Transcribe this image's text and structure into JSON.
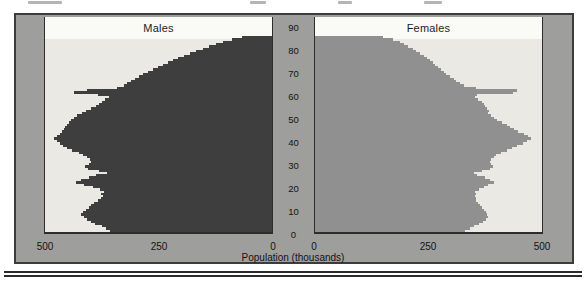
{
  "colors": {
    "male_bar": "#3e3e3e",
    "female_bar": "#909090",
    "panel_background": "#ebe9e4",
    "top_band": "#fafaf6",
    "matte_background": "#9e9e9c",
    "frame_border": "#3c3c3c",
    "axis_line": "#2d2d2d",
    "text": "#141414",
    "bottom_rule": "#2b2b2b"
  },
  "chart_data": {
    "type": "bar",
    "subtype": "population-pyramid",
    "orientation": "horizontal",
    "xlabel": "Population (thousands)",
    "age_axis": {
      "ticks": [
        0,
        10,
        20,
        30,
        40,
        50,
        60,
        70,
        80,
        90
      ],
      "min": 0,
      "max_drawn_age": 84,
      "bin_years": 1
    },
    "x_axis": {
      "max_each_side": 500,
      "unit": "thousands",
      "left_panel_ticks": [
        500,
        250,
        0
      ],
      "right_panel_ticks": [
        0,
        250,
        500
      ]
    },
    "legend_position": "panel-top-band",
    "series": [
      {
        "name": "Males",
        "side": "left",
        "color": "#3e3e3e",
        "age_start": 0,
        "values": [
          355,
          365,
          372,
          388,
          398,
          406,
          412,
          418,
          414,
          408,
          402,
          396,
          390,
          382,
          376,
          370,
          374,
          368,
          378,
          392,
          412,
          430,
          418,
          402,
          386,
          362,
          380,
          404,
          410,
          402,
          396,
          399,
          406,
          414,
          424,
          438,
          450,
          458,
          466,
          472,
          478,
          471,
          466,
          461,
          456,
          453,
          450,
          446,
          441,
          434,
          427,
          417,
          407,
          397,
          387,
          379,
          373,
          366,
          358,
          381,
          434,
          406,
          339,
          325,
          318,
          309,
          300,
          291,
          282,
          272,
          262,
          251,
          240,
          229,
          218,
          206,
          193,
          180,
          166,
          152,
          138,
          123,
          107,
          88,
          66
        ]
      },
      {
        "name": "Females",
        "side": "right",
        "color": "#909090",
        "age_start": 0,
        "values": [
          330,
          340,
          348,
          360,
          368,
          374,
          379,
          378,
          374,
          370,
          366,
          362,
          358,
          354,
          352,
          350,
          354,
          350,
          360,
          370,
          380,
          392,
          384,
          372,
          356,
          348,
          366,
          384,
          390,
          386,
          384,
          386,
          392,
          398,
          408,
          420,
          432,
          444,
          456,
          466,
          474,
          468,
          458,
          446,
          436,
          428,
          420,
          410,
          400,
          392,
          386,
          380,
          382,
          378,
          372,
          370,
          366,
          358,
          350,
          355,
          435,
          442,
          352,
          326,
          318,
          310,
          304,
          296,
          288,
          282,
          276,
          270,
          264,
          258,
          252,
          246,
          238,
          230,
          222,
          214,
          205,
          196,
          186,
          172,
          150
        ]
      }
    ]
  }
}
